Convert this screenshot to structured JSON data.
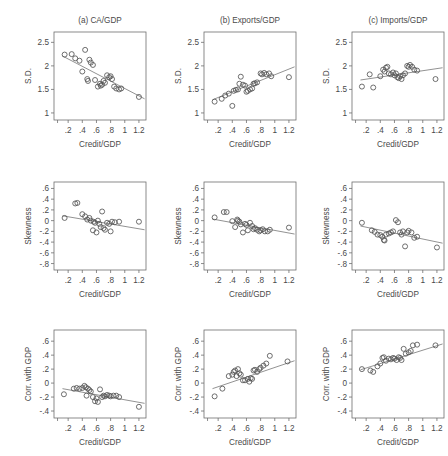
{
  "figure": {
    "axis_x_title": "Credit/GDP",
    "x_ticks": [
      ".2",
      ".4",
      ".6",
      ".8",
      "1",
      "1.2"
    ],
    "x_tick_values": [
      0.2,
      0.4,
      0.6,
      0.8,
      1.0,
      1.2
    ],
    "x_range": [
      0.0,
      1.3
    ],
    "point_color": "#555555",
    "line_color": "#6e6e6e",
    "frame_color": "#6e6e6e"
  },
  "chart_data": [
    {
      "id": "a-sd",
      "type": "scatter",
      "title": "(a) CA/GDP",
      "xlabel": "Credit/GDP",
      "ylabel": "S.D.",
      "xlim": [
        0.0,
        1.3
      ],
      "ylim": [
        0.85,
        2.72
      ],
      "yticks": [
        1,
        1.5,
        2,
        2.5
      ],
      "ytick_labels": [
        "1",
        "1.5",
        "2",
        "2.5"
      ],
      "grid": false,
      "legend": "none",
      "fit": {
        "x": [
          0.12,
          1.28
        ],
        "y": [
          2.21,
          1.3
        ]
      },
      "x": [
        0.15,
        0.25,
        0.3,
        0.36,
        0.4,
        0.44,
        0.47,
        0.48,
        0.5,
        0.52,
        0.55,
        0.58,
        0.62,
        0.65,
        0.66,
        0.68,
        0.7,
        0.72,
        0.75,
        0.78,
        0.8,
        0.82,
        0.85,
        0.88,
        0.92,
        0.95,
        1.2
      ],
      "y": [
        2.24,
        2.25,
        2.16,
        2.11,
        1.88,
        2.34,
        1.72,
        1.68,
        2.13,
        2.07,
        2.02,
        1.7,
        1.56,
        1.62,
        1.58,
        1.6,
        1.68,
        1.64,
        1.8,
        1.76,
        1.78,
        1.72,
        1.56,
        1.52,
        1.5,
        1.52,
        1.34
      ]
    },
    {
      "id": "b-sd",
      "type": "scatter",
      "title": "(b) Exports/GDP",
      "xlabel": "Credit/GDP",
      "ylabel": "S.D.",
      "xlim": [
        0.0,
        1.3
      ],
      "ylim": [
        0.85,
        2.72
      ],
      "yticks": [
        1,
        1.5,
        2,
        2.5
      ],
      "ytick_labels": [
        "1",
        "1.5",
        "2",
        "2.5"
      ],
      "grid": false,
      "legend": "none",
      "fit": {
        "x": [
          0.12,
          1.28
        ],
        "y": [
          1.28,
          1.98
        ]
      },
      "x": [
        0.15,
        0.25,
        0.3,
        0.35,
        0.4,
        0.42,
        0.45,
        0.48,
        0.5,
        0.52,
        0.55,
        0.58,
        0.6,
        0.62,
        0.65,
        0.68,
        0.7,
        0.72,
        0.75,
        0.8,
        0.82,
        0.85,
        0.88,
        0.92,
        0.95,
        1.2
      ],
      "y": [
        1.24,
        1.3,
        1.37,
        1.41,
        1.15,
        1.47,
        1.49,
        1.5,
        1.62,
        1.77,
        1.6,
        1.58,
        1.45,
        1.47,
        1.5,
        1.52,
        1.62,
        1.63,
        1.65,
        1.84,
        1.82,
        1.85,
        1.82,
        1.84,
        1.78,
        1.76
      ]
    },
    {
      "id": "c-sd",
      "type": "scatter",
      "title": "(c) Imports/GDP",
      "xlabel": "Credit/GDP",
      "ylabel": "S.D.",
      "xlim": [
        0.0,
        1.3
      ],
      "ylim": [
        0.85,
        2.72
      ],
      "yticks": [
        1,
        1.5,
        2,
        2.5
      ],
      "ytick_labels": [
        "1",
        "1.5",
        "2",
        "2.5"
      ],
      "grid": false,
      "legend": "none",
      "fit": {
        "x": [
          0.12,
          1.28
        ],
        "y": [
          1.7,
          1.96
        ]
      },
      "x": [
        0.14,
        0.25,
        0.3,
        0.4,
        0.44,
        0.46,
        0.48,
        0.5,
        0.52,
        0.55,
        0.58,
        0.6,
        0.62,
        0.64,
        0.66,
        0.68,
        0.7,
        0.72,
        0.75,
        0.78,
        0.8,
        0.82,
        0.85,
        0.88,
        0.92,
        1.18
      ],
      "y": [
        1.56,
        1.82,
        1.54,
        1.78,
        1.92,
        1.88,
        1.96,
        1.98,
        1.84,
        1.82,
        1.86,
        1.8,
        1.84,
        1.76,
        1.74,
        1.78,
        1.72,
        1.8,
        1.84,
        2.0,
        1.98,
        2.02,
        1.98,
        1.92,
        1.9,
        1.72
      ]
    },
    {
      "id": "a-skew",
      "type": "scatter",
      "title": "",
      "xlabel": "Credit/GDP",
      "ylabel": "Skewness",
      "xlim": [
        0.0,
        1.3
      ],
      "ylim": [
        -0.92,
        0.72
      ],
      "yticks": [
        0.6,
        0.4,
        0.2,
        0,
        -0.2,
        -0.4,
        -0.6,
        -0.8
      ],
      "ytick_labels": [
        ".6",
        ".4",
        ".2",
        "0",
        "-.2",
        "-.4",
        "-.6",
        "-.8"
      ],
      "grid": false,
      "legend": "none",
      "fit": {
        "x": [
          0.12,
          1.28
        ],
        "y": [
          0.09,
          -0.17
        ]
      },
      "x": [
        0.15,
        0.3,
        0.33,
        0.4,
        0.44,
        0.47,
        0.5,
        0.52,
        0.55,
        0.56,
        0.58,
        0.6,
        0.62,
        0.64,
        0.66,
        0.68,
        0.7,
        0.72,
        0.75,
        0.78,
        0.8,
        0.82,
        0.86,
        0.92,
        1.2
      ],
      "y": [
        0.05,
        0.32,
        0.33,
        0.12,
        0.08,
        0.02,
        0.05,
        0.0,
        -0.18,
        -0.02,
        -0.04,
        -0.22,
        0.0,
        -0.06,
        -0.12,
        0.17,
        -0.14,
        -0.17,
        -0.04,
        -0.06,
        -0.2,
        -0.02,
        -0.03,
        -0.02,
        -0.02
      ]
    },
    {
      "id": "b-skew",
      "type": "scatter",
      "title": "",
      "xlabel": "Credit/GDP",
      "ylabel": "Skewness",
      "xlim": [
        0.0,
        1.3
      ],
      "ylim": [
        -0.92,
        0.72
      ],
      "yticks": [
        0.6,
        0.4,
        0.2,
        0,
        -0.2,
        -0.4,
        -0.6,
        -0.8
      ],
      "ytick_labels": [
        ".6",
        ".4",
        ".2",
        "0",
        "-.2",
        "-.4",
        "-.6",
        "-.8"
      ],
      "grid": false,
      "legend": "none",
      "fit": {
        "x": [
          0.12,
          1.28
        ],
        "y": [
          0.03,
          -0.25
        ]
      },
      "x": [
        0.15,
        0.28,
        0.32,
        0.4,
        0.44,
        0.47,
        0.48,
        0.5,
        0.52,
        0.55,
        0.58,
        0.6,
        0.62,
        0.65,
        0.68,
        0.7,
        0.72,
        0.75,
        0.78,
        0.8,
        0.83,
        0.86,
        0.9,
        0.93,
        1.2
      ],
      "y": [
        0.06,
        0.16,
        0.16,
        -0.01,
        -0.12,
        0.02,
        0.0,
        -0.02,
        -0.07,
        -0.22,
        -0.06,
        -0.08,
        -0.18,
        -0.04,
        -0.1,
        -0.16,
        -0.14,
        -0.17,
        -0.2,
        -0.18,
        -0.16,
        -0.2,
        -0.2,
        -0.17,
        -0.13
      ]
    },
    {
      "id": "c-skew",
      "type": "scatter",
      "title": "",
      "xlabel": "Credit/GDP",
      "ylabel": "Skewness",
      "xlim": [
        0.0,
        1.3
      ],
      "ylim": [
        -0.92,
        0.72
      ],
      "yticks": [
        0.6,
        0.4,
        0.2,
        0,
        -0.2,
        -0.4,
        -0.6,
        -0.8
      ],
      "ytick_labels": [
        ".6",
        ".4",
        ".2",
        "0",
        "-.2",
        "-.4",
        "-.6",
        "-.8"
      ],
      "grid": false,
      "legend": "none",
      "fit": {
        "x": [
          0.12,
          1.28
        ],
        "y": [
          -0.1,
          -0.42
        ]
      },
      "x": [
        0.14,
        0.28,
        0.32,
        0.36,
        0.4,
        0.43,
        0.45,
        0.46,
        0.48,
        0.52,
        0.55,
        0.58,
        0.62,
        0.65,
        0.68,
        0.7,
        0.72,
        0.75,
        0.78,
        0.8,
        0.84,
        0.88,
        0.92,
        1.2
      ],
      "y": [
        -0.04,
        -0.18,
        -0.21,
        -0.26,
        -0.27,
        -0.3,
        -0.36,
        -0.37,
        -0.26,
        -0.24,
        -0.22,
        -0.2,
        0.01,
        -0.03,
        -0.22,
        -0.26,
        -0.2,
        -0.48,
        -0.22,
        -0.19,
        -0.22,
        -0.32,
        -0.3,
        -0.5
      ]
    },
    {
      "id": "a-corr",
      "type": "scatter",
      "title": "",
      "xlabel": "Credit/GDP",
      "ylabel": "Corr. with GDP",
      "xlim": [
        0.0,
        1.3
      ],
      "ylim": [
        -0.5,
        0.76
      ],
      "yticks": [
        0.6,
        0.4,
        0.2,
        0,
        -0.2,
        -0.4
      ],
      "ytick_labels": [
        ".6",
        ".4",
        ".2",
        "0",
        "-.2",
        "-.4"
      ],
      "grid": false,
      "legend": "none",
      "fit": {
        "x": [
          0.12,
          1.28
        ],
        "y": [
          -0.08,
          -0.29
        ]
      },
      "x": [
        0.14,
        0.28,
        0.32,
        0.36,
        0.4,
        0.43,
        0.45,
        0.46,
        0.48,
        0.5,
        0.52,
        0.55,
        0.58,
        0.6,
        0.62,
        0.65,
        0.68,
        0.7,
        0.72,
        0.75,
        0.78,
        0.8,
        0.84,
        0.88,
        0.92,
        1.2
      ],
      "y": [
        -0.16,
        -0.08,
        -0.07,
        -0.08,
        -0.07,
        -0.04,
        -0.06,
        -0.18,
        -0.08,
        -0.1,
        -0.12,
        -0.2,
        -0.26,
        -0.22,
        -0.27,
        -0.09,
        -0.2,
        -0.18,
        -0.19,
        -0.17,
        -0.18,
        -0.19,
        -0.18,
        -0.18,
        -0.2,
        -0.34
      ]
    },
    {
      "id": "b-corr",
      "type": "scatter",
      "title": "",
      "xlabel": "Credit/GDP",
      "ylabel": "Corr. with GDP",
      "xlim": [
        0.0,
        1.3
      ],
      "ylim": [
        -0.5,
        0.76
      ],
      "yticks": [
        0.6,
        0.4,
        0.2,
        0,
        -0.2,
        -0.4
      ],
      "ytick_labels": [
        ".6",
        ".4",
        ".2",
        "0",
        "-.2",
        "-.4"
      ],
      "grid": false,
      "legend": "none",
      "fit": {
        "x": [
          0.12,
          1.28
        ],
        "y": [
          -0.08,
          0.32
        ]
      },
      "x": [
        0.15,
        0.26,
        0.35,
        0.4,
        0.42,
        0.44,
        0.46,
        0.48,
        0.5,
        0.52,
        0.55,
        0.58,
        0.62,
        0.64,
        0.66,
        0.68,
        0.7,
        0.72,
        0.75,
        0.78,
        0.8,
        0.84,
        0.88,
        0.93,
        1.18
      ],
      "y": [
        -0.19,
        -0.08,
        0.1,
        0.12,
        0.16,
        0.18,
        0.1,
        0.2,
        0.14,
        0.12,
        0.04,
        0.04,
        0.06,
        0.02,
        0.07,
        0.06,
        0.18,
        0.19,
        0.16,
        0.2,
        0.22,
        0.25,
        0.28,
        0.39,
        0.31
      ]
    },
    {
      "id": "c-corr",
      "type": "scatter",
      "title": "",
      "xlabel": "Credit/GDP",
      "ylabel": "Corr. with GDP",
      "xlim": [
        0.0,
        1.3
      ],
      "ylim": [
        -0.5,
        0.76
      ],
      "yticks": [
        0.6,
        0.4,
        0.2,
        0,
        -0.2,
        -0.4
      ],
      "ytick_labels": [
        ".6",
        ".4",
        ".2",
        "0",
        "-.2",
        "-.4"
      ],
      "grid": false,
      "legend": "none",
      "fit": {
        "x": [
          0.12,
          1.28
        ],
        "y": [
          0.19,
          0.56
        ]
      },
      "x": [
        0.14,
        0.26,
        0.3,
        0.36,
        0.4,
        0.43,
        0.45,
        0.48,
        0.52,
        0.55,
        0.58,
        0.6,
        0.63,
        0.66,
        0.68,
        0.7,
        0.73,
        0.76,
        0.8,
        0.83,
        0.86,
        0.92,
        1.18
      ],
      "y": [
        0.2,
        0.18,
        0.16,
        0.24,
        0.28,
        0.36,
        0.37,
        0.32,
        0.35,
        0.34,
        0.36,
        0.35,
        0.33,
        0.37,
        0.36,
        0.33,
        0.49,
        0.42,
        0.44,
        0.46,
        0.54,
        0.55,
        0.54
      ]
    }
  ]
}
